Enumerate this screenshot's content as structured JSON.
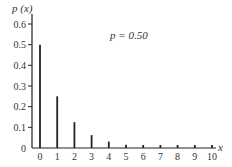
{
  "chart_data": {
    "type": "bar",
    "title": "",
    "annotation": "p = 0.50",
    "xlabel": "x",
    "ylabel": "p (x)",
    "categories": [
      "0",
      "1",
      "2",
      "3",
      "4",
      "5",
      "6",
      "7",
      "8",
      "9",
      "10"
    ],
    "x": [
      0,
      1,
      2,
      3,
      4,
      5,
      6,
      7,
      8,
      9,
      10
    ],
    "values": [
      0.5,
      0.25,
      0.125,
      0.0625,
      0.03125,
      0.015625,
      0.0078125,
      0.0039,
      0.002,
      0.001,
      0.0005
    ],
    "yticks": [
      "0",
      "0.1",
      "0.2",
      "0.3",
      "0.4",
      "0.5",
      "0.6"
    ],
    "ylim": [
      0,
      0.6
    ],
    "xlim": [
      0,
      10
    ],
    "grid": false,
    "legend": null,
    "bar_color": "#222222"
  },
  "labels": {
    "ylabel": "p (x)",
    "xlabel": "x",
    "annotation": "p = 0.50"
  }
}
